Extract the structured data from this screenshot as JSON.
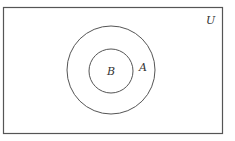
{
  "diagram": {
    "type": "venn",
    "universe": {
      "label": "U"
    },
    "sets": [
      {
        "label": "A",
        "contains": [
          "B"
        ]
      },
      {
        "label": "B",
        "subset_of": "A"
      }
    ],
    "colors": {
      "stroke": "#555555",
      "background": "#ffffff",
      "text": "#333333"
    }
  }
}
